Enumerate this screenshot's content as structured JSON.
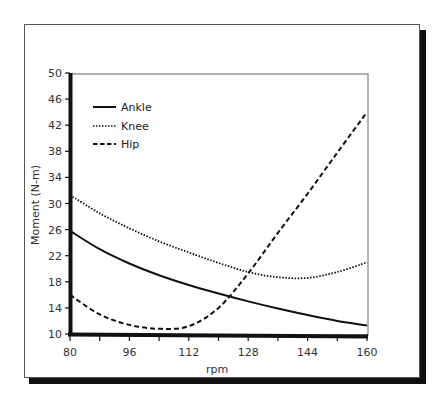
{
  "chart_data": {
    "type": "line",
    "title": "",
    "xlabel": "rpm",
    "ylabel": "Moment (N-m)",
    "xlim": [
      80,
      160
    ],
    "ylim": [
      10,
      50
    ],
    "x_ticks": [
      80,
      96,
      112,
      128,
      144,
      160
    ],
    "x_minor_step": 8,
    "y_ticks": [
      10,
      14,
      18,
      22,
      26,
      30,
      34,
      38,
      42,
      46,
      50
    ],
    "grid": false,
    "legend_position": "upper-left",
    "x": [
      80,
      88,
      96,
      104,
      112,
      120,
      128,
      136,
      144,
      152,
      160
    ],
    "series": [
      {
        "name": "Ankle",
        "style": "solid",
        "values": [
          25.8,
          23.0,
          20.8,
          19.0,
          17.5,
          16.2,
          15.0,
          13.9,
          12.9,
          12.0,
          11.3
        ]
      },
      {
        "name": "Knee",
        "style": "dotted",
        "values": [
          31.3,
          28.5,
          26.2,
          24.2,
          22.5,
          20.9,
          19.5,
          18.7,
          18.6,
          19.5,
          21.0
        ]
      },
      {
        "name": "Hip",
        "style": "dashed",
        "values": [
          16.0,
          13.0,
          11.4,
          10.8,
          11.2,
          14.0,
          19.3,
          25.5,
          31.5,
          37.8,
          44.0
        ]
      }
    ]
  },
  "legend": {
    "items": [
      {
        "label": "Ankle"
      },
      {
        "label": "Knee"
      },
      {
        "label": "Hip"
      }
    ]
  },
  "axes": {
    "xlabel": "rpm",
    "ylabel": "Moment (N-m)",
    "x_tick_labels": [
      "80",
      "96",
      "112",
      "128",
      "144",
      "160"
    ],
    "y_tick_labels": [
      "10",
      "14",
      "18",
      "22",
      "26",
      "30",
      "34",
      "38",
      "42",
      "46",
      "50"
    ]
  },
  "colors": {
    "line": "#111111",
    "frame_border": "#555555",
    "shadow": "#111111"
  }
}
